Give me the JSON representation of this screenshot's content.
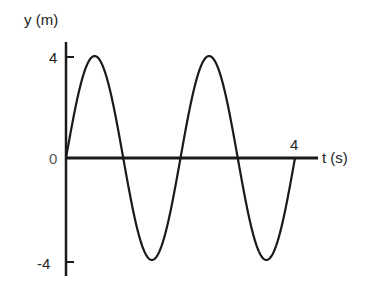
{
  "chart_data": {
    "type": "line",
    "title": "",
    "xlabel": "t (s)",
    "ylabel": "y (m)",
    "xlim": [
      0,
      4
    ],
    "ylim": [
      -4,
      4
    ],
    "x_ticks": [
      "4"
    ],
    "y_ticks": [
      "4",
      "0",
      "-4"
    ],
    "grid": false,
    "legend": null,
    "series": [
      {
        "name": "y(t) = 4 sin(πt)",
        "amplitude": 4,
        "period": 2,
        "x": [
          0,
          0.5,
          1,
          1.5,
          2,
          2.5,
          3,
          3.5,
          4
        ],
        "y": [
          0,
          4,
          0,
          -4,
          0,
          4,
          0,
          -4,
          0
        ]
      }
    ]
  },
  "labels": {
    "y_axis": "y (m)",
    "x_axis": "t (s)",
    "y_max": "4",
    "y_zero": "0",
    "y_min": "-4",
    "x_max": "4"
  },
  "colors": {
    "ink": "#1a1a1a",
    "background": "#ffffff"
  }
}
